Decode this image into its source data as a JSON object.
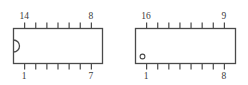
{
  "figure": {
    "background_color": "#ffffff",
    "line_color": "#4a4a4a",
    "text_color": "#3b3b3b"
  },
  "packages": [
    {
      "id": "dip-14",
      "name": "14-pin DIP package outline",
      "pin_count": 14,
      "pins_per_side": 7,
      "marker": "notch",
      "marker_side": "left",
      "labels": {
        "top_left": "14",
        "top_right": "8",
        "bottom_left": "1",
        "bottom_right": "7"
      },
      "body": {
        "x": 13,
        "y": 28,
        "width": 89,
        "height": 35
      },
      "tick_length": 6,
      "notch": {
        "radius": 6
      }
    },
    {
      "id": "dip-16",
      "name": "16-pin DIP package outline",
      "pin_count": 16,
      "pins_per_side": 8,
      "marker": "dot",
      "marker_side": "bottom-left",
      "labels": {
        "top_left": "16",
        "top_right": "9",
        "bottom_left": "1",
        "bottom_right": "8"
      },
      "body": {
        "x": 135,
        "y": 28,
        "width": 100,
        "height": 35
      },
      "tick_length": 6,
      "dot": {
        "radius": 2.4,
        "offset_x": 7,
        "offset_y": 7
      }
    }
  ]
}
